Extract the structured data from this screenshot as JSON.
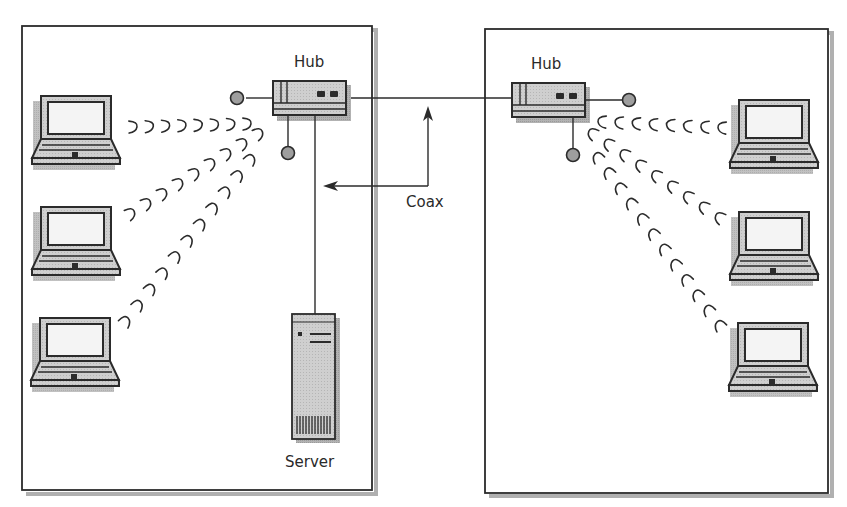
{
  "diagram": {
    "type": "network-topology",
    "segments": [
      {
        "name": "left",
        "hub": {
          "label": "Hub"
        },
        "server": {
          "label": "Server"
        },
        "laptops": 3,
        "wireless_links": 3
      },
      {
        "name": "right",
        "hub": {
          "label": "Hub"
        },
        "laptops": 3,
        "wireless_links": 3
      }
    ],
    "backbone": {
      "label": "Coax",
      "connects": [
        "left hub",
        "right hub"
      ]
    },
    "colors": {
      "stroke": "#2b2b2b",
      "device_fill": "#c8c8c8",
      "screen_fill": "#f4f4f4",
      "shadow": "#a9a9a9",
      "background": "#ffffff"
    }
  }
}
